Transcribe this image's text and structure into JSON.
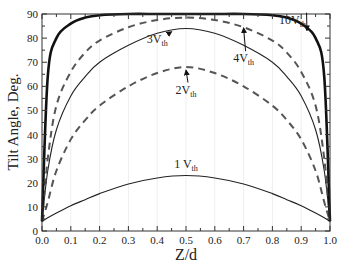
{
  "chart_data": {
    "type": "line",
    "title": "",
    "xlabel": "Z/d",
    "ylabel": "Tilt Angle, Deg.",
    "xlim": [
      0.0,
      1.0
    ],
    "ylim": [
      0,
      90
    ],
    "x_ticks": [
      "0.0",
      "0.1",
      "0.2",
      "0.3",
      "0.4",
      "0.5",
      "0.6",
      "0.7",
      "0.8",
      "0.9",
      "1.0"
    ],
    "y_ticks": [
      "0",
      "10",
      "20",
      "30",
      "40",
      "50",
      "60",
      "70",
      "80",
      "90"
    ],
    "grid": "vertical faint",
    "legend": "inline labels with arrows",
    "x": [
      0.0,
      0.02,
      0.05,
      0.1,
      0.15,
      0.2,
      0.3,
      0.4,
      0.5,
      0.6,
      0.7,
      0.8,
      0.85,
      0.9,
      0.95,
      0.98,
      1.0
    ],
    "series": [
      {
        "name": "1 V_th",
        "style": "thin-solid",
        "values": [
          4,
          5.5,
          7.5,
          10.5,
          13,
          15.5,
          19.5,
          22,
          23,
          22,
          19.5,
          15.5,
          13,
          10.5,
          7.5,
          5.5,
          4
        ]
      },
      {
        "name": "2V_th",
        "style": "dashed",
        "values": [
          4,
          12,
          25,
          38,
          46,
          52,
          60,
          65.5,
          68,
          65.5,
          60,
          52,
          46,
          38,
          25,
          12,
          4
        ]
      },
      {
        "name": "3V_th",
        "style": "thin-solid",
        "values": [
          4,
          25,
          42,
          56,
          64,
          70,
          77,
          82,
          84,
          82,
          77,
          70,
          64,
          56,
          42,
          25,
          4
        ]
      },
      {
        "name": "4V_th",
        "style": "dashed",
        "values": [
          4,
          30,
          52,
          66,
          74,
          79,
          84.5,
          87.5,
          88.5,
          87.5,
          84.5,
          79,
          74,
          66,
          52,
          30,
          4
        ]
      },
      {
        "name": "10V_th",
        "style": "thick-solid",
        "values": [
          4,
          64,
          80,
          86,
          88.5,
          89.5,
          90,
          90,
          90,
          90,
          90,
          89.5,
          88.5,
          86,
          80,
          64,
          4
        ]
      }
    ],
    "annotations": [
      {
        "text": "1 V",
        "sub": "th",
        "x": 0.5,
        "y": 26
      },
      {
        "text": "2V",
        "sub": "th",
        "x": 0.5,
        "y": 57,
        "arrow_to": [
          0.5,
          67.5
        ]
      },
      {
        "text": "3V",
        "sub": "th",
        "x": 0.4,
        "y": 78,
        "arrow_to": [
          0.45,
          83.5
        ]
      },
      {
        "text": "4V",
        "sub": "th",
        "x": 0.7,
        "y": 70,
        "arrow_to": [
          0.7,
          85
        ]
      },
      {
        "text": "10V",
        "sub": "th",
        "x": 0.87,
        "y": 86,
        "arrow_to": [
          0.92,
          84
        ]
      }
    ]
  }
}
